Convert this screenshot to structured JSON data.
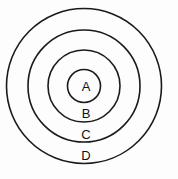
{
  "diagram": {
    "type": "concentric-circles",
    "title": "",
    "background_color": "#fdfdfd",
    "stroke_color": "#1a1a1a",
    "label_color": "#111111",
    "center": {
      "x": 84,
      "y": 86
    },
    "rings": [
      {
        "id": "ring-a",
        "label": "A",
        "radius": 16.5,
        "label_x": 86,
        "label_y": 88
      },
      {
        "id": "ring-b",
        "label": "B",
        "radius": 36,
        "label_x": 86,
        "label_y": 115
      },
      {
        "id": "ring-c",
        "label": "C",
        "radius": 56,
        "label_x": 86,
        "label_y": 136
      },
      {
        "id": "ring-d",
        "label": "D",
        "radius": 77.5,
        "label_x": 86,
        "label_y": 157
      }
    ]
  }
}
